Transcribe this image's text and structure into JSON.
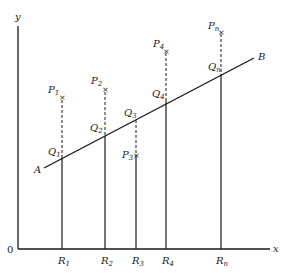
{
  "diagram": {
    "axes": {
      "origin_label": "0",
      "x_label": "x",
      "y_label": "y"
    },
    "line": {
      "start_label": "A",
      "end_label": "B"
    },
    "points": [
      {
        "p": "P",
        "p_sub": "1",
        "q": "Q",
        "q_sub": "1",
        "r": "R",
        "r_sub": "1"
      },
      {
        "p": "P",
        "p_sub": "2",
        "q": "Q",
        "q_sub": "2",
        "r": "R",
        "r_sub": "2"
      },
      {
        "p": "P",
        "p_sub": "3",
        "q": "Q",
        "q_sub": "3",
        "r": "R",
        "r_sub": "3"
      },
      {
        "p": "P",
        "p_sub": "4",
        "q": "Q",
        "q_sub": "4",
        "r": "R",
        "r_sub": "4"
      },
      {
        "p": "P",
        "p_sub": "n",
        "q": "Q",
        "q_sub": "n",
        "r": "R",
        "r_sub": "n"
      }
    ],
    "colors": {
      "ink": "#1a1a1a",
      "background": "#ffffff"
    }
  }
}
